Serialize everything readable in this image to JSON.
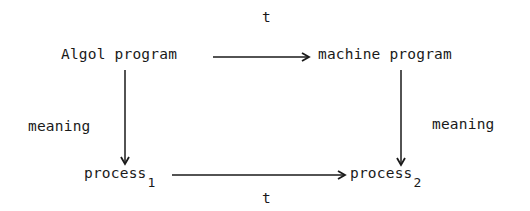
{
  "diagram": {
    "nodes": {
      "top_left": "Algol program",
      "top_right": "machine program",
      "bottom_left": {
        "text": "process",
        "subscript": "1"
      },
      "bottom_right": {
        "text": "process",
        "subscript": "2"
      }
    },
    "edges": {
      "top": {
        "label": "t",
        "from": "Algol program",
        "to": "machine program"
      },
      "bottom": {
        "label": "t",
        "from": "process_1",
        "to": "process_2"
      },
      "left": {
        "label": "meaning",
        "from": "Algol program",
        "to": "process_1"
      },
      "right": {
        "label": "meaning",
        "from": "machine program",
        "to": "process_2"
      }
    },
    "colors": {
      "ink": "#1a1a1a",
      "background": "#ffffff"
    }
  }
}
